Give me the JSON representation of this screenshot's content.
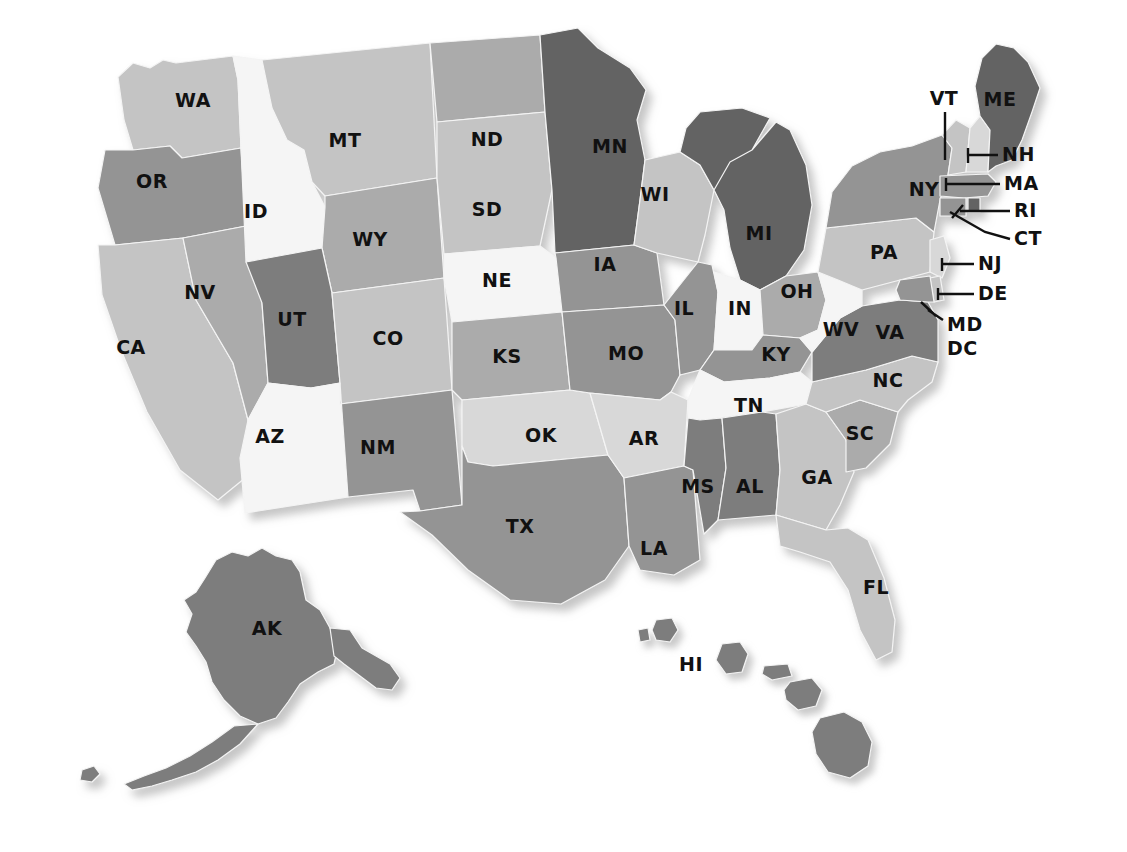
{
  "map": {
    "title": "United States State Abbreviation Map",
    "projection": "albers-usa-stylized",
    "background_color": "#ffffff",
    "border_color": "#f4f4f4",
    "label_color": "#111111",
    "shadow_color": "#8f8f8f",
    "palette": {
      "very_light": "#f5f5f5",
      "light": "#d8d8d8",
      "light_mid": "#c4c4c4",
      "mid": "#ababab",
      "mid_dark": "#949494",
      "dark": "#7d7d7d",
      "very_dark": "#636363"
    },
    "states": [
      {
        "code": "WA",
        "name": "Washington",
        "fill": "#c4c4c4",
        "label_x": 193,
        "label_y": 101
      },
      {
        "code": "OR",
        "name": "Oregon",
        "fill": "#949494",
        "label_x": 152,
        "label_y": 182
      },
      {
        "code": "CA",
        "name": "California",
        "fill": "#c4c4c4",
        "label_x": 131,
        "label_y": 348
      },
      {
        "code": "NV",
        "name": "Nevada",
        "fill": "#ababab",
        "label_x": 200,
        "label_y": 293
      },
      {
        "code": "ID",
        "name": "Idaho",
        "fill": "#f5f5f5",
        "label_x": 256,
        "label_y": 212
      },
      {
        "code": "MT",
        "name": "Montana",
        "fill": "#c4c4c4",
        "label_x": 345,
        "label_y": 141
      },
      {
        "code": "WY",
        "name": "Wyoming",
        "fill": "#ababab",
        "label_x": 370,
        "label_y": 240
      },
      {
        "code": "UT",
        "name": "Utah",
        "fill": "#7d7d7d",
        "label_x": 292,
        "label_y": 320
      },
      {
        "code": "AZ",
        "name": "Arizona",
        "fill": "#f5f5f5",
        "label_x": 270,
        "label_y": 437
      },
      {
        "code": "CO",
        "name": "Colorado",
        "fill": "#c4c4c4",
        "label_x": 388,
        "label_y": 339
      },
      {
        "code": "NM",
        "name": "New Mexico",
        "fill": "#949494",
        "label_x": 378,
        "label_y": 448
      },
      {
        "code": "ND",
        "name": "North Dakota",
        "fill": "#ababab",
        "label_x": 487,
        "label_y": 140
      },
      {
        "code": "SD",
        "name": "South Dakota",
        "fill": "#c4c4c4",
        "label_x": 487,
        "label_y": 210
      },
      {
        "code": "NE",
        "name": "Nebraska",
        "fill": "#f5f5f5",
        "label_x": 497,
        "label_y": 281
      },
      {
        "code": "KS",
        "name": "Kansas",
        "fill": "#ababab",
        "label_x": 507,
        "label_y": 357
      },
      {
        "code": "OK",
        "name": "Oklahoma",
        "fill": "#d8d8d8",
        "label_x": 541,
        "label_y": 436
      },
      {
        "code": "TX",
        "name": "Texas",
        "fill": "#949494",
        "label_x": 520,
        "label_y": 527
      },
      {
        "code": "MN",
        "name": "Minnesota",
        "fill": "#636363",
        "label_x": 610,
        "label_y": 147
      },
      {
        "code": "IA",
        "name": "Iowa",
        "fill": "#949494",
        "label_x": 605,
        "label_y": 265
      },
      {
        "code": "MO",
        "name": "Missouri",
        "fill": "#949494",
        "label_x": 626,
        "label_y": 354
      },
      {
        "code": "AR",
        "name": "Arkansas",
        "fill": "#d8d8d8",
        "label_x": 644,
        "label_y": 439
      },
      {
        "code": "LA",
        "name": "Louisiana",
        "fill": "#949494",
        "label_x": 654,
        "label_y": 549
      },
      {
        "code": "WI",
        "name": "Wisconsin",
        "fill": "#c4c4c4",
        "label_x": 655,
        "label_y": 195
      },
      {
        "code": "IL",
        "name": "Illinois",
        "fill": "#949494",
        "label_x": 684,
        "label_y": 309
      },
      {
        "code": "MI",
        "name": "Michigan",
        "fill": "#636363",
        "label_x": 759,
        "label_y": 234
      },
      {
        "code": "IN",
        "name": "Indiana",
        "fill": "#f5f5f5",
        "label_x": 740,
        "label_y": 309
      },
      {
        "code": "OH",
        "name": "Ohio",
        "fill": "#ababab",
        "label_x": 797,
        "label_y": 292
      },
      {
        "code": "KY",
        "name": "Kentucky",
        "fill": "#949494",
        "label_x": 776,
        "label_y": 355
      },
      {
        "code": "TN",
        "name": "Tennessee",
        "fill": "#f5f5f5",
        "label_x": 749,
        "label_y": 406
      },
      {
        "code": "MS",
        "name": "Mississippi",
        "fill": "#7d7d7d",
        "label_x": 698,
        "label_y": 487
      },
      {
        "code": "AL",
        "name": "Alabama",
        "fill": "#7d7d7d",
        "label_x": 750,
        "label_y": 487
      },
      {
        "code": "GA",
        "name": "Georgia",
        "fill": "#c4c4c4",
        "label_x": 817,
        "label_y": 478
      },
      {
        "code": "FL",
        "name": "Florida",
        "fill": "#c4c4c4",
        "label_x": 876,
        "label_y": 588
      },
      {
        "code": "SC",
        "name": "South Carolina",
        "fill": "#ababab",
        "label_x": 860,
        "label_y": 434
      },
      {
        "code": "NC",
        "name": "North Carolina",
        "fill": "#c4c4c4",
        "label_x": 888,
        "label_y": 381
      },
      {
        "code": "VA",
        "name": "Virginia",
        "fill": "#7d7d7d",
        "label_x": 890,
        "label_y": 333
      },
      {
        "code": "WV",
        "name": "West Virginia",
        "fill": "#f5f5f5",
        "label_x": 841,
        "label_y": 330
      },
      {
        "code": "PA",
        "name": "Pennsylvania",
        "fill": "#c4c4c4",
        "label_x": 884,
        "label_y": 253
      },
      {
        "code": "NY",
        "name": "New York",
        "fill": "#949494",
        "label_x": 924,
        "label_y": 190
      },
      {
        "code": "ME",
        "name": "Maine",
        "fill": "#636363",
        "label_x": 1000,
        "label_y": 100
      },
      {
        "code": "AK",
        "name": "Alaska",
        "fill": "#7d7d7d",
        "label_x": 267,
        "label_y": 629
      },
      {
        "code": "HI",
        "name": "Hawaii",
        "fill": "#7d7d7d",
        "label_x": 691,
        "label_y": 665
      }
    ],
    "callouts": [
      {
        "code": "VT",
        "name": "Vermont",
        "fill": "#c4c4c4",
        "label_x": 944,
        "label_y": 99,
        "align": "middle",
        "line": "M 945 112 L 945 160"
      },
      {
        "code": "NH",
        "name": "New Hampshire",
        "fill": "#d8d8d8",
        "label_x": 1002,
        "label_y": 155,
        "align": "start",
        "line": "M 998 155 L 968 155 M 968 148 L 968 163"
      },
      {
        "code": "MA",
        "name": "Massachusetts",
        "fill": "#949494",
        "label_x": 1004,
        "label_y": 184,
        "align": "start",
        "line": "M 1000 184 L 946 184 M 946 178 L 946 191"
      },
      {
        "code": "RI",
        "name": "Rhode Island",
        "fill": "#636363",
        "label_x": 1014,
        "label_y": 211,
        "align": "start",
        "line": "M 1010 211 L 960 211 M 963 205 L 952 218"
      },
      {
        "code": "CT",
        "name": "Connecticut",
        "fill": "#949494",
        "label_x": 1014,
        "label_y": 239,
        "align": "start",
        "line": "M 1010 239 L 985 232 L 950 212"
      },
      {
        "code": "NJ",
        "name": "New Jersey",
        "fill": "#d8d8d8",
        "label_x": 978,
        "label_y": 264,
        "align": "start",
        "line": "M 974 264 L 942 264 M 942 258 L 942 271"
      },
      {
        "code": "DE",
        "name": "Delaware",
        "fill": "#c4c4c4",
        "label_x": 978,
        "label_y": 294,
        "align": "start",
        "line": "M 974 294 L 938 294 M 938 288 L 938 300"
      },
      {
        "code": "MD",
        "name": "Maryland",
        "fill": "#949494",
        "label_x": 947,
        "label_y": 325,
        "align": "start",
        "line": "M 943 320 L 928 310 M 921 302 L 936 316"
      },
      {
        "code": "DC",
        "name": "District of Columbia",
        "fill": "#949494",
        "label_x": 947,
        "label_y": 349,
        "align": "start",
        "line": ""
      }
    ]
  }
}
